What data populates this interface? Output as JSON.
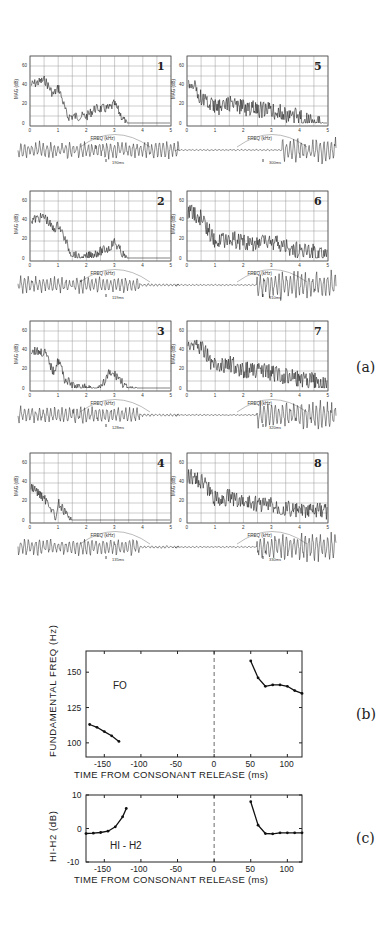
{
  "figure": {
    "part_labels": {
      "a": "(a)",
      "b": "(b)",
      "c": "(c)"
    },
    "spectra": {
      "y_axis_label": "MAG (dB)",
      "x_axis_label": "FREQ (kHz)",
      "y_ticks": [
        "0",
        "20",
        "40",
        "60"
      ],
      "x_ticks": [
        "0",
        "1",
        "2",
        "3",
        "4",
        "5"
      ],
      "panels": [
        {
          "id": "1",
          "time_mark": "190ms"
        },
        {
          "id": "2",
          "time_mark": "119ms"
        },
        {
          "id": "3",
          "time_mark": "128ms"
        },
        {
          "id": "4",
          "time_mark": "135ms"
        },
        {
          "id": "5",
          "time_mark": "300ms"
        },
        {
          "id": "6",
          "time_mark": "310ms"
        },
        {
          "id": "7",
          "time_mark": "320ms"
        },
        {
          "id": "8",
          "time_mark": "330ms"
        }
      ]
    }
  },
  "chart_data": [
    {
      "type": "line",
      "title": "F0",
      "panel": "(b)",
      "xlabel": "TIME FROM CONSONANT RELEASE (ms)",
      "ylabel": "FUNDAMENTAL FREQ (Hz)",
      "x_ticks": [
        "-150",
        "-100",
        "-50",
        "0",
        "50",
        "100"
      ],
      "y_ticks": [
        "100",
        "125",
        "150"
      ],
      "xlim": [
        -175,
        120
      ],
      "ylim": [
        90,
        165
      ],
      "annotation": "dashed vertical line at x=0",
      "series": [
        {
          "name": "pre-release",
          "x": [
            -170,
            -160,
            -150,
            -140,
            -130
          ],
          "y": [
            113,
            111,
            108,
            105,
            101
          ]
        },
        {
          "name": "post-release",
          "x": [
            50,
            60,
            70,
            80,
            90,
            100,
            110,
            120
          ],
          "y": [
            158,
            146,
            140,
            141,
            141,
            140,
            137,
            135
          ]
        }
      ]
    },
    {
      "type": "line",
      "title": "H1-H2",
      "panel": "(c)",
      "xlabel": "TIME FROM CONSONANT RELEASE (ms)",
      "ylabel": "H1-H2 (dB)",
      "x_ticks": [
        "-150",
        "-100",
        "-50",
        "0",
        "50",
        "100"
      ],
      "y_ticks": [
        "-10",
        "0",
        "10"
      ],
      "xlim": [
        -175,
        120
      ],
      "ylim": [
        -10,
        10
      ],
      "annotation": "dashed vertical line at x=0",
      "series": [
        {
          "name": "pre-release",
          "x": [
            -175,
            -165,
            -155,
            -145,
            -135,
            -125,
            -120
          ],
          "y": [
            -1.5,
            -1.4,
            -1.2,
            -0.8,
            0.5,
            3.5,
            6
          ]
        },
        {
          "name": "post-release",
          "x": [
            50,
            60,
            70,
            80,
            90,
            100,
            110,
            120
          ],
          "y": [
            8,
            1,
            -1.5,
            -1.6,
            -1.3,
            -1.3,
            -1.3,
            -1.3
          ]
        }
      ]
    }
  ],
  "plots": {
    "b": {
      "title": "FO",
      "ylabel": "FUNDAMENTAL FREQ (Hz)",
      "xlabel": "TIME FROM CONSONANT RELEASE (ms)",
      "x_ticks": [
        "-150",
        "-100",
        "-50",
        "0",
        "50",
        "100"
      ],
      "y_ticks": [
        "100",
        "125",
        "150"
      ]
    },
    "c": {
      "title": "HI - H2",
      "ylabel": "HI-H2 (dB)",
      "xlabel": "TIME FROM CONSONANT RELEASE (ms)",
      "x_ticks": [
        "-150",
        "-100",
        "-50",
        "0",
        "50",
        "100"
      ],
      "y_ticks": [
        "-10",
        "0",
        "10"
      ]
    }
  }
}
